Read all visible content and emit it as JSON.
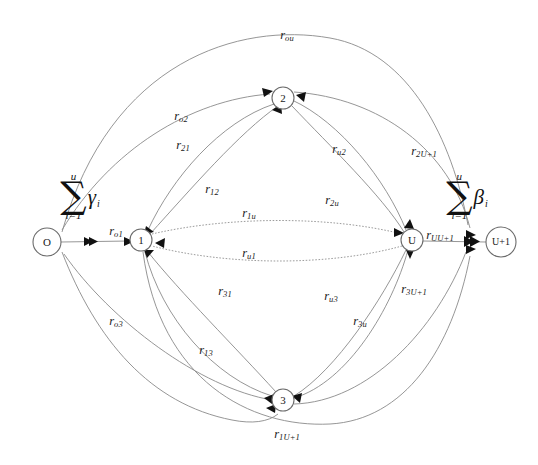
{
  "diagram": {
    "nodes": [
      {
        "id": "O",
        "label": "O",
        "cx": 47,
        "cy": 242,
        "r": 14
      },
      {
        "id": "n1",
        "label": "1",
        "cx": 141,
        "cy": 240,
        "r": 11
      },
      {
        "id": "n2",
        "label": "2",
        "cx": 283,
        "cy": 98,
        "r": 11
      },
      {
        "id": "n3",
        "label": "3",
        "cx": 283,
        "cy": 400,
        "r": 11
      },
      {
        "id": "U",
        "label": "U",
        "cx": 412,
        "cy": 240,
        "r": 11
      },
      {
        "id": "Up1",
        "label": "U+1",
        "cx": 501,
        "cy": 242,
        "r": 15
      }
    ],
    "source_sum": {
      "upper": "u",
      "sigma": "∑",
      "lower": "i=1",
      "symbol": "γ",
      "subscript": "i",
      "x": 80,
      "y": 196
    },
    "sink_sum": {
      "upper": "u",
      "sigma": "∑",
      "lower": "i=1",
      "symbol": "β",
      "subscript": "i",
      "x": 467,
      "y": 196
    },
    "edge_labels": [
      {
        "name": "r-ou",
        "base": "r",
        "sub": "ou",
        "x": 287,
        "y": 36
      },
      {
        "name": "r-o2",
        "base": "r",
        "sub": "o2",
        "x": 181,
        "y": 117
      },
      {
        "name": "r-21",
        "base": "r",
        "sub": "21",
        "x": 183,
        "y": 146
      },
      {
        "name": "r-12",
        "base": "r",
        "sub": "12",
        "x": 212,
        "y": 190
      },
      {
        "name": "r-u2",
        "base": "r",
        "sub": "u2",
        "x": 339,
        "y": 150
      },
      {
        "name": "r-2u",
        "base": "r",
        "sub": "2u",
        "x": 332,
        "y": 201
      },
      {
        "name": "r-2U1",
        "base": "r",
        "sub": "2U+1",
        "x": 424,
        "y": 152
      },
      {
        "name": "r-o1",
        "base": "r",
        "sub": "o1",
        "x": 116,
        "y": 232
      },
      {
        "name": "r-1u",
        "base": "r",
        "sub": "1u",
        "x": 249,
        "y": 214
      },
      {
        "name": "r-u1",
        "base": "r",
        "sub": "u1",
        "x": 249,
        "y": 254
      },
      {
        "name": "r-UU1",
        "base": "r",
        "sub": "UU+1",
        "x": 440,
        "y": 236
      },
      {
        "name": "r-31",
        "base": "r",
        "sub": "31",
        "x": 225,
        "y": 292
      },
      {
        "name": "r-13",
        "base": "r",
        "sub": "13",
        "x": 206,
        "y": 351
      },
      {
        "name": "r-o3",
        "base": "r",
        "sub": "o3",
        "x": 116,
        "y": 322
      },
      {
        "name": "r-u3",
        "base": "r",
        "sub": "u3",
        "x": 331,
        "y": 297
      },
      {
        "name": "r-3u",
        "base": "r",
        "sub": "3u",
        "x": 360,
        "y": 322
      },
      {
        "name": "r-3U1",
        "base": "r",
        "sub": "3U+1",
        "x": 414,
        "y": 290
      },
      {
        "name": "r-1U1",
        "base": "r",
        "sub": "1U+1",
        "x": 287,
        "y": 435
      }
    ]
  }
}
